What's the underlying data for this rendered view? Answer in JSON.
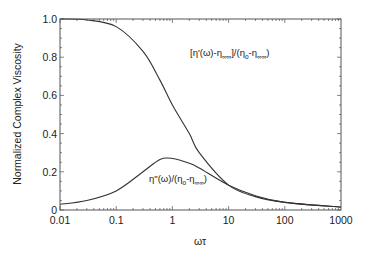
{
  "chart_data": {
    "type": "line",
    "title": "",
    "xlabel": "ωτ",
    "ylabel": "Normalized Complex Viscosity",
    "xscale": "log",
    "xlim": [
      0.01,
      1000
    ],
    "ylim": [
      0,
      1.0
    ],
    "xticks": [
      "0.01",
      "0.1",
      "1",
      "10",
      "100",
      "1000"
    ],
    "yticks": [
      "0",
      "0.2",
      "0.4",
      "0.6",
      "0.8",
      "1.0"
    ],
    "grid": false,
    "legend": "none (curves labeled inline)",
    "x": [
      0.01,
      0.03,
      0.1,
      0.3,
      0.6,
      1,
      2,
      3,
      10,
      30,
      100,
      1000
    ],
    "series": [
      {
        "name": "[η'(ω)-η∞]/(ηo-η∞)",
        "values": [
          1.0,
          0.995,
          0.96,
          0.83,
          0.68,
          0.55,
          0.4,
          0.3,
          0.13,
          0.07,
          0.04,
          0.015
        ]
      },
      {
        "name": "η\"(ω)/(ηo-η∞)",
        "values": [
          0.03,
          0.05,
          0.1,
          0.2,
          0.265,
          0.27,
          0.245,
          0.22,
          0.13,
          0.075,
          0.04,
          0.015
        ]
      }
    ],
    "annotations": [
      {
        "text": "[η'(ω)-η∞]/(ηo-η∞)",
        "near_x": 10,
        "near_y": 0.78
      },
      {
        "text": "η\"(ω)/(ηo-η∞)",
        "near_x": 3,
        "near_y": 0.2
      }
    ]
  },
  "labels": {
    "xlabel": "ωτ",
    "ylabel": "Normalized Complex Viscosity",
    "curve1_main": "[η'(ω)-η",
    "curve1_sub1": "∞∞",
    "curve1_mid": "]/(η",
    "curve1_sub2": "o",
    "curve1_mid2": "-η",
    "curve1_sub3": "∞∞",
    "curve1_end": ")",
    "curve2_main": "η\"(ω)/(η",
    "curve2_sub1": "o",
    "curve2_mid": "-η",
    "curve2_sub2": "∞∞",
    "curve2_end": ")"
  }
}
